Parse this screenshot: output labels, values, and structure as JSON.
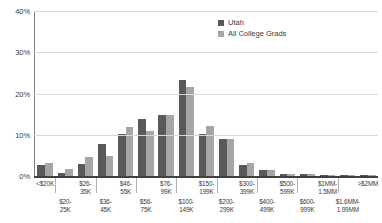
{
  "chart_data": {
    "type": "bar",
    "title": "",
    "subtitle": "",
    "xlabel": "",
    "ylabel": "",
    "ylim": [
      0,
      40
    ],
    "ytick_labels": [
      "0%",
      "10%",
      "20%",
      "30%",
      "40%"
    ],
    "ytick_values": [
      0,
      10,
      20,
      30,
      40
    ],
    "grid": true,
    "legend_position": "top-right",
    "categories": [
      "<$20K",
      "$20-\n25K",
      "$26-\n35K",
      "$36-\n45K",
      "$46-\n55K",
      "$56-\n75K",
      "$76-\n99K",
      "$100-\n149K",
      "$150-\n199K",
      "$200-\n299K",
      "$300-\n399K",
      "$400-\n499K",
      "$500-\n599K",
      "$600-\n999K",
      "$1MM-\n1.5MM",
      "$1.6MM-\n1.99MM",
      ">$2MM"
    ],
    "categories_flat": [
      "<$20K",
      "$20-25K",
      "$26-35K",
      "$36-45K",
      "$46-55K",
      "$56-75K",
      "$76-99K",
      "$100-149K",
      "$150-199K",
      "$200-299K",
      "$300-399K",
      "$400-499K",
      "$500-599K",
      "$600-999K",
      "$1MM-1.5MM",
      "$1.6MM-1.99MM",
      ">$2MM"
    ],
    "series": [
      {
        "name": "Utah",
        "color": "#595959",
        "values": [
          2.6,
          0.8,
          3.0,
          7.7,
          10.3,
          13.8,
          14.9,
          23.2,
          10.2,
          8.9,
          2.6,
          1.5,
          0.5,
          0.4,
          0.3,
          0.2,
          0.2
        ]
      },
      {
        "name": "All College Grads",
        "color": "#a6a6a6",
        "values": [
          3.1,
          1.8,
          4.6,
          4.8,
          12.0,
          11.0,
          14.9,
          21.6,
          12.2,
          9.0,
          3.2,
          1.4,
          0.5,
          0.4,
          0.3,
          0.2,
          0.2
        ]
      }
    ]
  },
  "legend": {
    "items": [
      {
        "label": "Utah",
        "color": "#595959"
      },
      {
        "label": "All College Grads",
        "color": "#a6a6a6"
      }
    ]
  },
  "colors": {
    "utah": "#595959",
    "all_college_grads": "#a6a6a6",
    "gridline": "#d9d9d9",
    "axis": "#404040",
    "text": "#3a3a3a",
    "background": "#ffffff"
  }
}
